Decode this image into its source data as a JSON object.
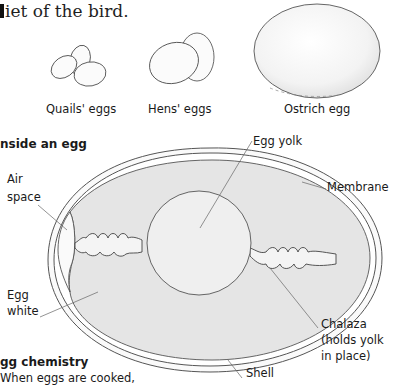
{
  "intro_text": "diet of the bird.",
  "intro_visible": "iet of the bird.",
  "egg_sizes": {
    "items": [
      {
        "label": "Quails' eggs"
      },
      {
        "label": "Hens' eggs"
      },
      {
        "label": "Ostrich egg"
      }
    ]
  },
  "inside_egg": {
    "heading": "nside an egg",
    "labels": {
      "air_space_1": "Air",
      "air_space_2": "space",
      "egg_yolk": "Egg yolk",
      "membrane": "Membrane",
      "egg_white_1": "Egg",
      "egg_white_2": "white",
      "chalaza_1": "Chalaza",
      "chalaza_2": "(holds yolk",
      "chalaza_3": "in place)",
      "shell": "Shell"
    }
  },
  "egg_chemistry": {
    "heading": "gg chemistry",
    "body": "When eggs are cooked,"
  },
  "colors": {
    "text": "#1a1a1a",
    "outline": "#555555",
    "egg_white_fill": "#e4e4e4",
    "yolk_fill": "#eeeeee",
    "shell_fill": "#fafafa"
  }
}
